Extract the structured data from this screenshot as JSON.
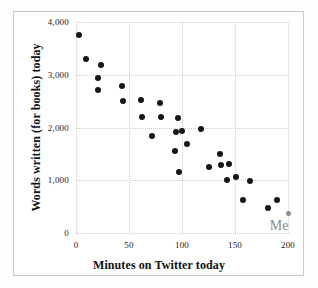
{
  "chart_data": {
    "type": "scatter",
    "title": "",
    "xlabel": "Minutes on Twitter today",
    "ylabel": "Words written (for books) today",
    "xlim": [
      0,
      200
    ],
    "ylim": [
      0,
      4000
    ],
    "xticks": [
      0,
      50,
      100,
      150,
      200
    ],
    "xtick_labels": [
      "0",
      "50",
      "100",
      "150",
      "200"
    ],
    "yticks": [
      0,
      1000,
      2000,
      3000,
      4000
    ],
    "ytick_labels": [
      "0",
      "1,000",
      "2,000",
      "3,000",
      "4,000"
    ],
    "grid": true,
    "legend": "none",
    "marker_color": "#161616",
    "highlight_color": "#8d8d8d",
    "annotations": [
      {
        "text": "Me",
        "x": 196,
        "y": 130,
        "color": "#8b8b8b",
        "points_to": {
          "x": 200,
          "y": 370
        }
      }
    ],
    "series": [
      {
        "name": "writers",
        "marker": "circle",
        "color": "#161616",
        "points": [
          {
            "x": 3,
            "y": 3750
          },
          {
            "x": 9,
            "y": 3290
          },
          {
            "x": 21,
            "y": 2940
          },
          {
            "x": 21,
            "y": 2720
          },
          {
            "x": 24,
            "y": 3190
          },
          {
            "x": 43,
            "y": 2790
          },
          {
            "x": 44,
            "y": 2500
          },
          {
            "x": 61,
            "y": 2530
          },
          {
            "x": 62,
            "y": 2190
          },
          {
            "x": 72,
            "y": 1830
          },
          {
            "x": 79,
            "y": 2460
          },
          {
            "x": 80,
            "y": 2200
          },
          {
            "x": 93,
            "y": 1550
          },
          {
            "x": 94,
            "y": 1910
          },
          {
            "x": 96,
            "y": 2180
          },
          {
            "x": 97,
            "y": 1150
          },
          {
            "x": 100,
            "y": 1940
          },
          {
            "x": 105,
            "y": 1690
          },
          {
            "x": 118,
            "y": 1970
          },
          {
            "x": 125,
            "y": 1260
          },
          {
            "x": 136,
            "y": 1500
          },
          {
            "x": 137,
            "y": 1280
          },
          {
            "x": 142,
            "y": 1000
          },
          {
            "x": 144,
            "y": 1300
          },
          {
            "x": 151,
            "y": 1060
          },
          {
            "x": 158,
            "y": 620
          },
          {
            "x": 164,
            "y": 980
          },
          {
            "x": 181,
            "y": 470
          },
          {
            "x": 190,
            "y": 630
          }
        ]
      },
      {
        "name": "me",
        "marker": "circle",
        "color": "#8d8d8d",
        "highlight": true,
        "points": [
          {
            "x": 200,
            "y": 370
          }
        ]
      }
    ]
  }
}
